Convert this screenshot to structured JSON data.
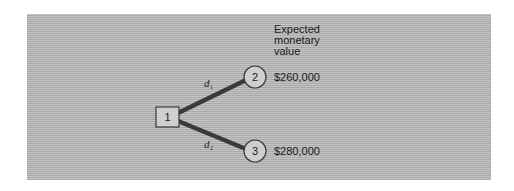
{
  "diagram": {
    "type": "decision-tree",
    "column_header": [
      "Expected",
      "monetary",
      "value"
    ],
    "nodes": [
      {
        "id": "1",
        "shape": "square",
        "label": "1",
        "kind": "decision"
      },
      {
        "id": "2",
        "shape": "circle",
        "label": "2",
        "kind": "chance"
      },
      {
        "id": "3",
        "shape": "circle",
        "label": "3",
        "kind": "chance"
      }
    ],
    "edges": [
      {
        "from": "1",
        "to": "2",
        "label": "d",
        "subscript": "1"
      },
      {
        "from": "1",
        "to": "3",
        "label": "d",
        "subscript": "2"
      }
    ],
    "values": [
      {
        "node": "2",
        "emv": "$260,000"
      },
      {
        "node": "3",
        "emv": "$280,000"
      }
    ],
    "colors": {
      "panel_background": "#b9b9b9",
      "edge": "#3a3a3a",
      "node_fill": "#cfcfcf",
      "node_stroke": "#3a3a3a"
    }
  }
}
